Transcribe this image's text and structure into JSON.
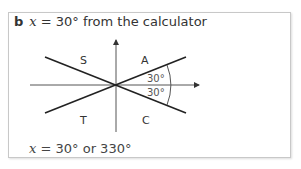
{
  "heading": {
    "label": "b",
    "variable": "x",
    "text": " = 30° from the calculator"
  },
  "diagram": {
    "quadrants": {
      "S": "S",
      "A": "A",
      "T": "T",
      "C": "C"
    },
    "angle_upper": "30°",
    "angle_lower": "30°"
  },
  "answer": {
    "variable": "x",
    "text": " = 30° or 330°"
  }
}
